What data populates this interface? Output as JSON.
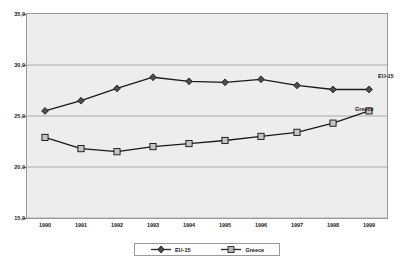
{
  "chart_data": {
    "type": "line",
    "title": "",
    "xlabel": "",
    "ylabel": "",
    "categories": [
      "1990",
      "1991",
      "1992",
      "1993",
      "1994",
      "1995",
      "1996",
      "1997",
      "1998",
      "1999"
    ],
    "ylim": [
      15.0,
      35.0
    ],
    "ytick_labels": [
      "15,0",
      "20,0",
      "25,0",
      "30,0",
      "35,0"
    ],
    "ytick_values": [
      15.0,
      20.0,
      25.0,
      30.0,
      35.0
    ],
    "grid": true,
    "legend_position": "bottom",
    "series": [
      {
        "name": "EU-15",
        "marker": "diamond",
        "color": "#4d4d4d",
        "values": [
          25.5,
          26.5,
          27.7,
          28.8,
          28.4,
          28.3,
          28.6,
          28.0,
          27.6,
          27.6
        ]
      },
      {
        "name": "Greece",
        "marker": "square",
        "color": "#8c8c8c",
        "values": [
          22.9,
          21.8,
          21.5,
          22.0,
          22.3,
          22.6,
          23.0,
          23.4,
          24.3,
          25.5
        ]
      }
    ],
    "annotations": [
      {
        "text": "EU-15",
        "series": "EU-15"
      },
      {
        "text": "Greece",
        "series": "Greece"
      }
    ]
  },
  "legend": {
    "items": [
      {
        "label": "EU-15",
        "marker": "diamond-marker"
      },
      {
        "label": "Greece",
        "marker": "square-marker"
      }
    ]
  }
}
